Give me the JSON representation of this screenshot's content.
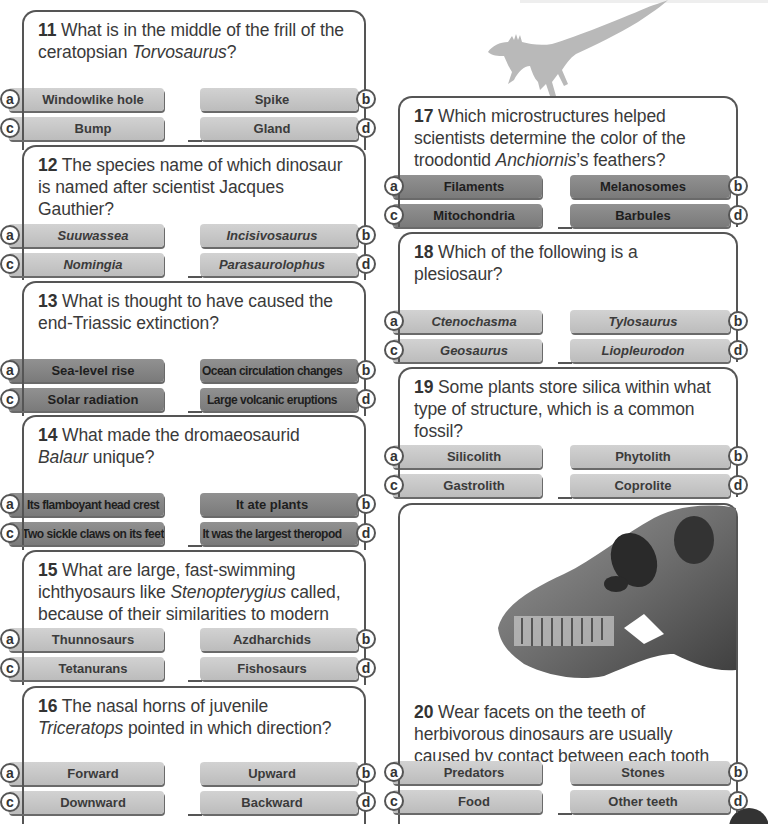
{
  "questions": [
    {
      "num": "11",
      "pre": " What is in the middle of the frill of the ceratopsian ",
      "ital": "Torvosaurus",
      "post": "?",
      "style": "light",
      "italic_answers": false,
      "answers": {
        "a": "Windowlike hole",
        "b": "Spike",
        "c": "Bump",
        "d": "Gland"
      }
    },
    {
      "num": "12",
      "pre": " The species name of which dinosaur is named after scientist Jacques Gauthier?",
      "ital": "",
      "post": "",
      "style": "light",
      "italic_answers": true,
      "answers": {
        "a": "Suuwassea",
        "b": "Incisivosaurus",
        "c": "Nomingia",
        "d": "Parasaurolophus"
      }
    },
    {
      "num": "13",
      "pre": " What is thought to have caused the end-Triassic extinction?",
      "ital": "",
      "post": "",
      "style": "dark",
      "italic_answers": false,
      "answers": {
        "a": "Sea-level rise",
        "b": "Ocean circulation changes",
        "c": "Solar radiation",
        "d": "Large volcanic eruptions"
      }
    },
    {
      "num": "14",
      "pre": " What made the dromaeosaurid ",
      "ital": "Balaur",
      "post": " unique?",
      "style": "dark",
      "italic_answers": false,
      "answers": {
        "a": "Its flamboyant head crest",
        "b": "It ate plants",
        "c": "Two sickle claws on its feet",
        "d": "It was the largest theropod"
      }
    },
    {
      "num": "15",
      "pre": " What are large, fast-swimming ichthyosaurs like ",
      "ital": "Stenopterygius",
      "post": " called, because of their similarities to modern tuna?",
      "style": "light",
      "italic_answers": false,
      "answers": {
        "a": "Thunnosaurs",
        "b": "Azdharchids",
        "c": "Tetanurans",
        "d": "Fishosaurs"
      }
    },
    {
      "num": "16",
      "pre": " The nasal horns of juvenile ",
      "ital": "Triceratops",
      "post": " pointed in which direction?",
      "style": "light",
      "italic_answers": false,
      "answers": {
        "a": "Forward",
        "b": "Upward",
        "c": "Downward",
        "d": "Backward"
      }
    },
    {
      "num": "17",
      "pre": " Which microstructures helped scientists determine the color of the troodontid ",
      "ital": "Anchiornis",
      "post": "’s feathers?",
      "style": "dark",
      "italic_answers": false,
      "answers": {
        "a": "Filaments",
        "b": "Melanosomes",
        "c": "Mitochondria",
        "d": "Barbules"
      }
    },
    {
      "num": "18",
      "pre": " Which of the following is a plesiosaur?",
      "ital": "",
      "post": "",
      "style": "light",
      "italic_answers": true,
      "answers": {
        "a": "Ctenochasma",
        "b": "Tylosaurus",
        "c": "Geosaurus",
        "d": "Liopleurodon"
      }
    },
    {
      "num": "19",
      "pre": " Some plants store silica within what type of structure, which is a common fossil?",
      "ital": "",
      "post": "",
      "style": "light",
      "italic_answers": false,
      "answers": {
        "a": "Silicolith",
        "b": "Phytolith",
        "c": "Gastrolith",
        "d": "Coprolite"
      }
    },
    {
      "num": "20",
      "pre": " Wear facets on the teeth of herbivorous dinosaurs are usually caused by contact between each tooth and what?",
      "ital": "",
      "post": "",
      "style": "light",
      "italic_answers": false,
      "answers": {
        "a": "Predators",
        "b": "Stones",
        "c": "Food",
        "d": "Other teeth"
      }
    }
  ],
  "letters": {
    "a": "a",
    "b": "b",
    "c": "c",
    "d": "d"
  },
  "images": {
    "raptor": "feathered-dinosaur-silhouette",
    "skull": "sauropod-skull-photo"
  },
  "colors": {
    "light_button": "#c6c6c6",
    "dark_button": "#858585",
    "border": "#555555",
    "text": "#3a3a3a"
  }
}
